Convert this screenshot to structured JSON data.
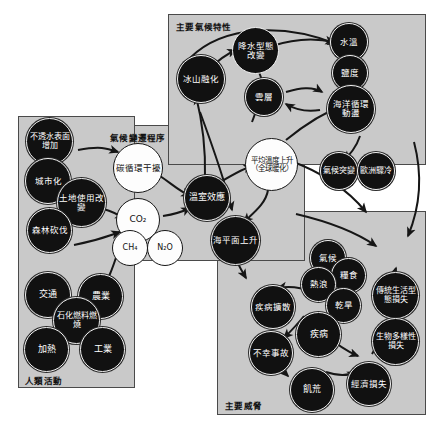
{
  "diagram": {
    "type": "causal-loop-diagram",
    "panels": [
      {
        "key": "human_activities",
        "title": "人類活動",
        "title_pos": "bottom-left"
      },
      {
        "key": "climate_processes",
        "title": "氣候變遷程序",
        "title_pos": "top-left"
      },
      {
        "key": "climate_features",
        "title": "主要氣候特性",
        "title_pos": "top-left"
      },
      {
        "key": "main_threats",
        "title": "主要威脅",
        "title_pos": "bottom-left"
      }
    ],
    "nodes": {
      "human_activities": [
        {
          "id": "impervious",
          "label": "不透水表面增加",
          "style": "dark"
        },
        {
          "id": "urbanization",
          "label": "城市化",
          "style": "dark"
        },
        {
          "id": "landuse",
          "label": "土地使用改變",
          "style": "dark"
        },
        {
          "id": "deforestation",
          "label": "森林砍伐",
          "style": "dark"
        },
        {
          "id": "transport",
          "label": "交通",
          "style": "dark"
        },
        {
          "id": "agriculture",
          "label": "農業",
          "style": "dark"
        },
        {
          "id": "fossil_fuel",
          "label": "石化燃料燃燒",
          "style": "dark"
        },
        {
          "id": "heating",
          "label": "加熱",
          "style": "dark"
        },
        {
          "id": "industry",
          "label": "工業",
          "style": "dark"
        }
      ],
      "climate_processes": [
        {
          "id": "carbon_cycle",
          "label": "碳循環干擾",
          "style": "light"
        },
        {
          "id": "co2",
          "label": "CO₂",
          "style": "light"
        },
        {
          "id": "ch4",
          "label": "CH₄",
          "style": "light"
        },
        {
          "id": "n2o",
          "label": "N₂O",
          "style": "light"
        },
        {
          "id": "greenhouse",
          "label": "溫室效應",
          "style": "dark"
        },
        {
          "id": "mean_temp",
          "label": "平均溫度上升（全球暖化）",
          "style": "light"
        },
        {
          "id": "sea_level",
          "label": "海平面上升",
          "style": "dark"
        }
      ],
      "climate_features": [
        {
          "id": "ice_melt",
          "label": "冰山融化",
          "style": "dark"
        },
        {
          "id": "precip_change",
          "label": "降水型態改變",
          "style": "light"
        },
        {
          "id": "clouds",
          "label": "雲層",
          "style": "dark"
        },
        {
          "id": "water_temp",
          "label": "水溫",
          "style": "dark"
        },
        {
          "id": "salinity",
          "label": "鹽度",
          "style": "dark"
        },
        {
          "id": "ocean_circ",
          "label": "海洋循環動盪",
          "style": "dark"
        },
        {
          "id": "abrupt_climate",
          "label": "氣候突變",
          "style": "dark"
        },
        {
          "id": "europe_cold",
          "label": "歐洲驟冷",
          "style": "dark"
        }
      ],
      "main_threats": [
        {
          "id": "climate",
          "label": "氣候",
          "style": "dark"
        },
        {
          "id": "food",
          "label": "糧食",
          "style": "dark"
        },
        {
          "id": "heatwave",
          "label": "熱浪",
          "style": "dark"
        },
        {
          "id": "drought",
          "label": "乾旱",
          "style": "dark"
        },
        {
          "id": "disease",
          "label": "疾病",
          "style": "dark"
        },
        {
          "id": "disease_spread",
          "label": "疾病擴散",
          "style": "dark"
        },
        {
          "id": "accidents",
          "label": "不幸事故",
          "style": "dark"
        },
        {
          "id": "famine",
          "label": "飢荒",
          "style": "dark"
        },
        {
          "id": "economic_loss",
          "label": "經濟損失",
          "style": "dark"
        },
        {
          "id": "tradition_loss",
          "label": "傳統生活型態損失",
          "style": "dark"
        },
        {
          "id": "biodiversity_loss",
          "label": "生物多樣性損失",
          "style": "dark"
        }
      ]
    },
    "colors": {
      "panel_fill": "#c9c9c9",
      "panel_border": "#4a4a4a",
      "node_dark": "#111111",
      "node_light": "#fdfdfd",
      "edge": "#1a1a1a",
      "background": "#ffffff"
    }
  }
}
